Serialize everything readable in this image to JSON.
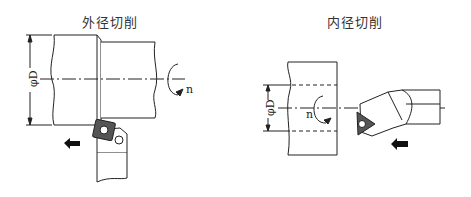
{
  "diagrams": [
    {
      "title": "外径切削",
      "diameter_label": "φD",
      "rotation_label": "n",
      "feed_direction": "left"
    },
    {
      "title": "内径切削",
      "diameter_label": "φD",
      "rotation_label": "n",
      "feed_direction": "left"
    }
  ],
  "colors": {
    "line": "#222222",
    "insert_fill": "#555555",
    "background": "#ffffff"
  }
}
